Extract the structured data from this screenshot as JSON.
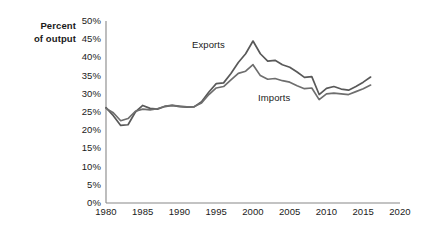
{
  "axis_title": {
    "line1": "Percent",
    "line2": "of output"
  },
  "series_labels": {
    "exports": "Exports",
    "imports": "Imports"
  },
  "chart_data": {
    "type": "line",
    "title": "",
    "xlabel": "",
    "ylabel": "Percent of output",
    "xlim": [
      1980,
      2020
    ],
    "ylim": [
      0,
      50
    ],
    "grid": false,
    "legend_position": "inline-annotation",
    "ytick_labels": [
      "50%",
      "45%",
      "40%",
      "35%",
      "30%",
      "25%",
      "20%",
      "15%",
      "10%",
      "5%",
      "0%"
    ],
    "ytick_values": [
      50,
      45,
      40,
      35,
      30,
      25,
      20,
      15,
      10,
      5,
      0
    ],
    "xtick_labels": [
      "1980",
      "1985",
      "1990",
      "1995",
      "2000",
      "2005",
      "2010",
      "2015",
      "2020"
    ],
    "xtick_values": [
      1980,
      1985,
      1990,
      1995,
      2000,
      2005,
      2010,
      2015,
      2020
    ],
    "x": [
      1980,
      1981,
      1982,
      1983,
      1984,
      1985,
      1986,
      1987,
      1988,
      1989,
      1990,
      1991,
      1992,
      1993,
      1994,
      1995,
      1996,
      1997,
      1998,
      1999,
      2000,
      2001,
      2002,
      2003,
      2004,
      2005,
      2006,
      2007,
      2008,
      2009,
      2010,
      2011,
      2012,
      2013,
      2014,
      2015,
      2016
    ],
    "series": [
      {
        "name": "Exports",
        "color": "#595959",
        "values": [
          26.2,
          24.0,
          21.3,
          21.5,
          25.0,
          26.8,
          26.0,
          25.8,
          26.5,
          26.8,
          26.5,
          26.3,
          26.4,
          27.8,
          30.5,
          32.8,
          33.0,
          35.6,
          38.6,
          41.0,
          44.5,
          41.0,
          39.0,
          39.2,
          38.0,
          37.3,
          36.0,
          34.5,
          34.7,
          29.8,
          31.5,
          32.0,
          31.3,
          31.0,
          32.0,
          33.2,
          34.6
        ],
        "peak": {
          "year": 2000,
          "value": 44.5
        }
      },
      {
        "name": "Imports",
        "color": "#6e6e6e",
        "values": [
          26.0,
          24.8,
          22.6,
          23.2,
          25.2,
          25.8,
          25.6,
          25.9,
          26.6,
          26.8,
          26.6,
          26.4,
          26.5,
          27.5,
          29.8,
          31.6,
          32.0,
          33.8,
          35.6,
          36.2,
          38.0,
          35.0,
          34.0,
          34.2,
          33.6,
          33.2,
          32.2,
          31.4,
          31.6,
          28.4,
          30.0,
          30.2,
          30.0,
          29.8,
          30.6,
          31.4,
          32.4
        ],
        "peak": {
          "year": 2000,
          "value": 38.0
        }
      }
    ]
  }
}
